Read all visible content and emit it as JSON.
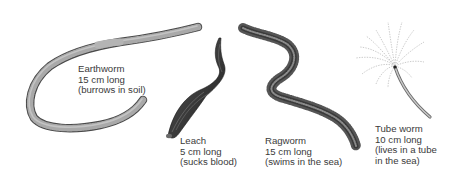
{
  "figure": {
    "background": "#ffffff",
    "text_color": "#3a3a3a",
    "worms": [
      {
        "id": "earthworm",
        "name": "Earthworm",
        "length": "15 cm long",
        "note": "(burrows in soil)"
      },
      {
        "id": "leach",
        "name": "Leach",
        "length": "5 cm long",
        "note": "(sucks blood)"
      },
      {
        "id": "ragworm",
        "name": "Ragworm",
        "length": "15 cm long",
        "note": "(swims in the sea)"
      },
      {
        "id": "tube-worm",
        "name": "Tube worm",
        "length": "10 cm long",
        "note_line1": "(lives in a tube",
        "note_line2": "in the sea)"
      }
    ]
  }
}
